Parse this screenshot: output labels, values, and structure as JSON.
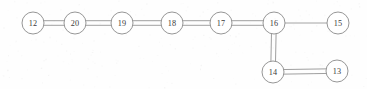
{
  "diagram": {
    "canvas": {
      "width": 367,
      "height": 89
    },
    "style": {
      "background_color": "#fefefe",
      "edge_color": "#8e8e8e",
      "node_stroke_color": "#8a8a8a",
      "node_fill_color": "#ffffff",
      "label_color": "#3a3a3a",
      "node_radius": 11,
      "double_edge_gap": 4.6
    },
    "nodes": [
      {
        "id": "12",
        "label": "12",
        "cx": 33,
        "cy": 23
      },
      {
        "id": "20",
        "label": "20",
        "cx": 75,
        "cy": 23
      },
      {
        "id": "19",
        "label": "19",
        "cx": 122,
        "cy": 23
      },
      {
        "id": "18",
        "label": "18",
        "cx": 172,
        "cy": 23
      },
      {
        "id": "17",
        "label": "17",
        "cx": 221,
        "cy": 23
      },
      {
        "id": "16",
        "label": "16",
        "cx": 274,
        "cy": 23
      },
      {
        "id": "15",
        "label": "15",
        "cx": 338,
        "cy": 23
      },
      {
        "id": "14",
        "label": "14",
        "cx": 273,
        "cy": 72
      },
      {
        "id": "13",
        "label": "13",
        "cx": 337,
        "cy": 71
      }
    ],
    "edges": [
      {
        "from": "12",
        "to": "20",
        "multiplicity": 2,
        "orientation": "horizontal"
      },
      {
        "from": "20",
        "to": "19",
        "multiplicity": 2,
        "orientation": "horizontal"
      },
      {
        "from": "19",
        "to": "18",
        "multiplicity": 2,
        "orientation": "horizontal"
      },
      {
        "from": "18",
        "to": "17",
        "multiplicity": 2,
        "orientation": "horizontal"
      },
      {
        "from": "17",
        "to": "16",
        "multiplicity": 2,
        "orientation": "horizontal"
      },
      {
        "from": "16",
        "to": "15",
        "multiplicity": 1,
        "orientation": "horizontal"
      },
      {
        "from": "16",
        "to": "14",
        "multiplicity": 2,
        "orientation": "vertical"
      },
      {
        "from": "14",
        "to": "13",
        "multiplicity": 2,
        "orientation": "horizontal"
      }
    ]
  }
}
